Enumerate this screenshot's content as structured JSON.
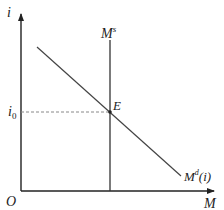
{
  "diagram": {
    "axes": {
      "y_label": "i",
      "x_label": "M",
      "origin_label": "O"
    },
    "curves": {
      "supply": {
        "label_base": "M",
        "label_sup": "s"
      },
      "demand": {
        "label_base": "M",
        "label_sup": "d",
        "label_arg": "(i)"
      }
    },
    "equilibrium": {
      "point_label": "E",
      "rate_label_base": "i",
      "rate_label_sub": "0"
    },
    "colors": {
      "axis": "#222222",
      "curve": "#444444",
      "dashed": "#888888"
    }
  }
}
